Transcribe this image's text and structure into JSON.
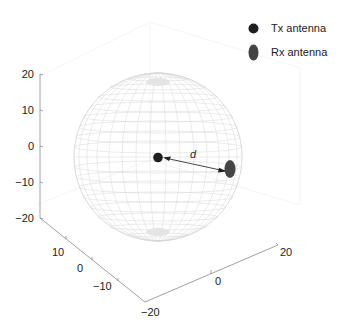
{
  "figure": {
    "legend": [
      {
        "label": "Tx antenna",
        "marker": "circle",
        "color": "#1f1f1f"
      },
      {
        "label": "Rx antenna",
        "marker": "ellipse",
        "color": "#444444"
      }
    ],
    "distance_label": "d",
    "z_axis": {
      "ticks": [
        "20",
        "10",
        "0",
        "−10",
        "−20"
      ]
    },
    "y_axis": {
      "ticks": [
        "10",
        "0",
        "−10"
      ]
    },
    "x_axis": {
      "ticks": [
        "−20",
        "0",
        "20"
      ]
    },
    "sphere": {
      "style": "wireframe",
      "color": "#d0d0d0"
    }
  }
}
